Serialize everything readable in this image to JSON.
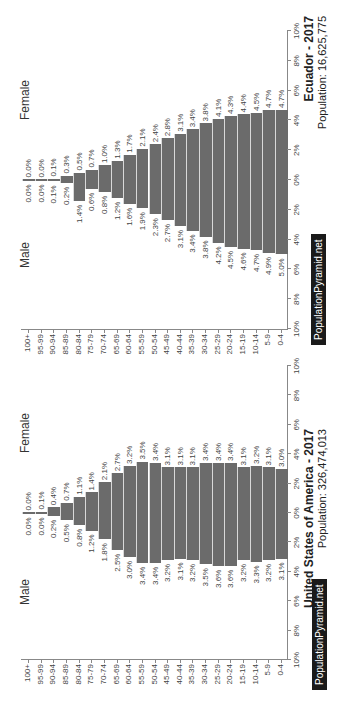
{
  "chart_data": [
    {
      "type": "bar",
      "subtype": "population-pyramid",
      "title": "United States of America - 2017",
      "subtitle": "Population: 326,474,013",
      "categories": [
        "100+",
        "95-99",
        "90-94",
        "85-89",
        "80-84",
        "75-79",
        "70-74",
        "65-69",
        "60-64",
        "55-59",
        "50-54",
        "45-49",
        "40-44",
        "35-39",
        "30-34",
        "25-29",
        "20-24",
        "15-19",
        "10-14",
        "5-9",
        "0-4"
      ],
      "series": [
        {
          "name": "Male",
          "values": [
            0.0,
            0.0,
            0.2,
            0.5,
            0.8,
            1.2,
            1.8,
            2.5,
            3.0,
            3.4,
            3.4,
            3.2,
            3.1,
            3.2,
            3.5,
            3.6,
            3.6,
            3.2,
            3.3,
            3.2,
            3.1
          ]
        },
        {
          "name": "Female",
          "values": [
            0.0,
            0.1,
            0.4,
            0.7,
            1.1,
            1.4,
            2.1,
            2.7,
            3.2,
            3.5,
            3.4,
            3.1,
            3.1,
            3.1,
            3.4,
            3.4,
            3.4,
            3.1,
            3.2,
            3.1,
            3.0
          ]
        }
      ],
      "xlabel": "",
      "ylabel": "",
      "xticks": [
        "10%",
        "8%",
        "6%",
        "4%",
        "2%",
        "0%",
        "2%",
        "4%",
        "6%",
        "8%",
        "10%"
      ],
      "xlim": [
        -10,
        10
      ],
      "legend": [
        "Male",
        "Female"
      ],
      "watermark": "PopulationPyramid.net"
    },
    {
      "type": "bar",
      "subtype": "population-pyramid",
      "title": "Ecuador - 2017",
      "subtitle": "Population: 16,625,775",
      "categories": [
        "100+",
        "95-99",
        "90-94",
        "85-89",
        "80-84",
        "75-79",
        "70-74",
        "65-69",
        "60-64",
        "55-59",
        "50-54",
        "45-49",
        "40-44",
        "35-39",
        "30-34",
        "25-29",
        "20-24",
        "15-19",
        "10-14",
        "5-9",
        "0-4"
      ],
      "series": [
        {
          "name": "Male",
          "values": [
            0.0,
            0.0,
            0.1,
            0.2,
            1.4,
            0.6,
            0.8,
            1.2,
            1.6,
            1.9,
            2.3,
            2.7,
            3.1,
            3.4,
            3.8,
            4.2,
            4.5,
            4.6,
            4.7,
            4.9,
            5.0
          ]
        },
        {
          "name": "Female",
          "values": [
            0.0,
            0.0,
            0.1,
            0.3,
            0.5,
            0.7,
            1.0,
            1.3,
            1.7,
            2.1,
            2.4,
            2.8,
            3.1,
            3.4,
            3.8,
            4.1,
            4.3,
            4.4,
            4.5,
            4.7,
            4.7
          ]
        }
      ],
      "xlabel": "",
      "ylabel": "",
      "xticks": [
        "10%",
        "8%",
        "6%",
        "4%",
        "2%",
        "0%",
        "2%",
        "4%",
        "6%",
        "8%",
        "10%"
      ],
      "xlim": [
        -10,
        10
      ],
      "legend": [
        "Male",
        "Female"
      ],
      "watermark": "PopulationPyramid.net"
    }
  ],
  "colors": {
    "bar": "#6b6b6b",
    "axis": "#888888",
    "watermark_bg": "#1a1a1a",
    "watermark_text": "#ffffff"
  },
  "charts": [
    {
      "male_label": "Male",
      "female_label": "Female",
      "title": "United States of America - 2017",
      "subtitle": "Population: 326,474,013",
      "brand": "PopulationPyramid.net"
    },
    {
      "male_label": "Male",
      "female_label": "Female",
      "title": "Ecuador - 2017",
      "subtitle": "Population: 16,625,775",
      "brand": "PopulationPyramid.net"
    }
  ]
}
